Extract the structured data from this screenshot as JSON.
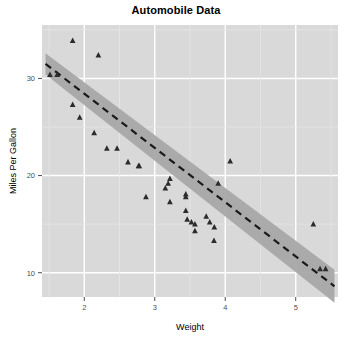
{
  "chart_data": {
    "type": "scatter",
    "title": "Automobile Data",
    "xlabel": "Weight",
    "ylabel": "Miles Per Gallon",
    "xlim": [
      1.4,
      5.6
    ],
    "ylim": [
      7.5,
      35.5
    ],
    "xticks": [
      2,
      3,
      4,
      5
    ],
    "yticks": [
      10,
      20,
      30
    ],
    "grid": true,
    "legend": "none",
    "marker": "triangle",
    "marker_color": "#2b2b2b",
    "plot_bg_color": "#d9d9d9",
    "grid_color": "#ffffff",
    "band_color": "#a8a8a8",
    "fit_line_color": "#1a1a1a",
    "fit_line_style": "dashed",
    "series": [
      {
        "name": "Automobiles",
        "x": [
          1.835,
          2.2,
          1.513,
          1.615,
          1.835,
          1.935,
          2.14,
          2.32,
          2.465,
          2.62,
          2.77,
          2.78,
          2.875,
          3.15,
          3.19,
          3.215,
          3.215,
          3.44,
          3.44,
          3.44,
          3.46,
          3.52,
          3.57,
          3.57,
          3.73,
          3.78,
          3.84,
          3.845,
          3.9,
          4.07,
          5.25,
          5.345,
          5.424
        ],
        "y": [
          33.9,
          32.4,
          30.4,
          30.4,
          27.3,
          26.0,
          24.4,
          22.8,
          22.8,
          21.4,
          21.0,
          21.0,
          17.8,
          18.7,
          19.2,
          19.7,
          17.3,
          18.1,
          17.8,
          16.4,
          15.5,
          15.2,
          15.0,
          14.3,
          15.8,
          15.2,
          13.3,
          14.7,
          19.2,
          21.5,
          15.0,
          10.4,
          10.4
        ]
      }
    ],
    "fit_line": {
      "name": "linear regression",
      "x_start": 1.45,
      "y_start": 31.5,
      "x_end": 5.55,
      "y_end": 8.6
    },
    "confidence_band": {
      "name": "confidence interval",
      "upper_start": 32.6,
      "lower_start": 30.4,
      "upper_end": 10.3,
      "lower_end": 6.9
    }
  }
}
